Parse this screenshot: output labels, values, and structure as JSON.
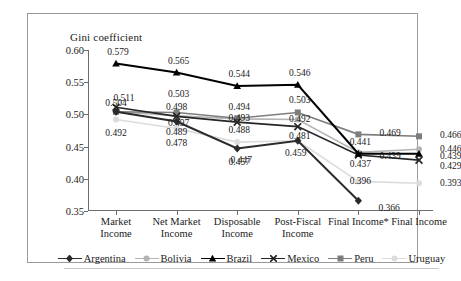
{
  "chart_data": {
    "type": "line",
    "title": "",
    "ylabel": "Gini coefficient",
    "xlabel": "",
    "ylim": [
      0.35,
      0.6
    ],
    "yticks": [
      "0.35",
      "0.40",
      "0.45",
      "0.50",
      "0.55",
      "0.60"
    ],
    "grid": false,
    "legend_position": "bottom",
    "categories": [
      "Market Income",
      "Net Market Income",
      "Disposable Income",
      "Post-Fiscal Income",
      "Final Income*",
      "Final Income"
    ],
    "category_lines": [
      [
        "Market",
        "Income"
      ],
      [
        "Net Market",
        "Income"
      ],
      [
        "Disposable",
        "Income"
      ],
      [
        "Post-Fiscal",
        "Income"
      ],
      [
        "Final Income*",
        ""
      ],
      [
        "Final Income",
        ""
      ]
    ],
    "series": [
      {
        "name": "Argentina",
        "color": "#2b2b2b",
        "marker": "diamond",
        "values": [
          0.504,
          0.489,
          0.447,
          0.459,
          0.366,
          null
        ],
        "labels": [
          "0.504",
          "0.489",
          "0.447",
          "0.459",
          "0.366",
          ""
        ]
      },
      {
        "name": "Bolivia",
        "color": "#b4b4b4",
        "marker": "circle",
        "values": [
          0.504,
          0.498,
          0.493,
          0.492,
          0.441,
          0.446
        ],
        "labels": [
          "",
          "0.498",
          "0.493",
          "0.492",
          "0.441",
          "0.446"
        ]
      },
      {
        "name": "Brazil",
        "color": "#000000",
        "marker": "triangle",
        "values": [
          0.579,
          0.565,
          0.544,
          0.546,
          0.439,
          0.439
        ],
        "labels": [
          "0.579",
          "0.565",
          "0.544",
          "0.546",
          "0.439",
          "0.439"
        ]
      },
      {
        "name": "Mexico",
        "color": "#262626",
        "marker": "cross",
        "values": [
          0.511,
          0.497,
          0.488,
          0.481,
          0.437,
          0.429
        ],
        "labels": [
          "0.511",
          "0.497",
          "0.488",
          "0.481",
          "0.437",
          "0.429"
        ]
      },
      {
        "name": "Peru",
        "color": "#7d7d7d",
        "marker": "square",
        "values": [
          0.504,
          0.503,
          0.494,
          0.503,
          0.469,
          0.466
        ],
        "labels": [
          "",
          "0.503",
          "0.494",
          "0.503",
          "0.469",
          "0.466"
        ]
      },
      {
        "name": "Uruguay",
        "color": "#dcdcdc",
        "marker": "circle-light",
        "values": [
          0.492,
          0.478,
          0.457,
          0.459,
          0.396,
          0.393
        ],
        "labels": [
          "0.492",
          "0.478",
          "0.457",
          "",
          "0.396",
          "0.393"
        ]
      }
    ],
    "annotations": [
      {
        "text": "0.511",
        "x": 0,
        "y": 0.511
      },
      {
        "text": "0.504",
        "x": 0,
        "y": 0.504
      },
      {
        "text": "0.492",
        "x": 0,
        "y": 0.492
      },
      {
        "text": "0.579",
        "x": 0,
        "y": 0.579
      }
    ]
  }
}
